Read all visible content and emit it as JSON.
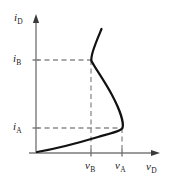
{
  "figure": {
    "type": "diagram",
    "background_color": "#ffffff",
    "curve_color": "#111111",
    "axis_color": "#7a7a7a",
    "dash_color": "#8c8c8c",
    "text_color": "#1a1a1a"
  },
  "axes": {
    "y": {
      "symbol": "i",
      "subscript": "D",
      "label": "iD",
      "arrow": true,
      "origin_px": {
        "x": 36,
        "y": 153
      },
      "top_px": {
        "x": 36,
        "y": 16
      }
    },
    "x": {
      "symbol": "v",
      "subscript": "D",
      "label": "vD",
      "arrow": true,
      "origin_px": {
        "x": 36,
        "y": 153
      },
      "right_px": {
        "x": 160,
        "y": 153
      }
    }
  },
  "ticks": {
    "y_ticks": [
      {
        "symbol": "i",
        "subscript": "B",
        "label": "iB",
        "y_px": 60
      },
      {
        "symbol": "i",
        "subscript": "A",
        "label": "iA",
        "y_px": 128
      }
    ],
    "x_ticks": [
      {
        "symbol": "v",
        "subscript": "B",
        "label": "vB",
        "x_px": 91
      },
      {
        "symbol": "v",
        "subscript": "A",
        "label": "vA",
        "x_px": 122
      }
    ]
  },
  "guide_lines": {
    "style": "dashed",
    "horizontal": [
      {
        "from_x": 36,
        "to_x": 91,
        "y": 60,
        "name": "ib-guide"
      },
      {
        "from_x": 36,
        "to_x": 122,
        "y": 128,
        "name": "ia-guide"
      }
    ],
    "vertical": [
      {
        "x": 91,
        "from_y": 60,
        "to_y": 153,
        "name": "vb-guide"
      },
      {
        "x": 122,
        "from_y": 128,
        "to_y": 153,
        "name": "va-guide"
      }
    ]
  },
  "chart_data": {
    "type": "line",
    "title": "",
    "xlabel": "vD",
    "ylabel": "iD",
    "annotations": [
      "iB",
      "iA",
      "vB",
      "vA"
    ],
    "curve_path": "M 37,152 C 55,149 78,143 98,137 C 112,133 121,131 122.5,128 C 124,123 120,110 112,95 C 104,80 95,68 91.5,61 C 91,59 91.5,56 93,51 C 95.5,43 99,35 101.5,29",
    "key_points": [
      {
        "name": "origin",
        "x_px": 37,
        "y_px": 152
      },
      {
        "name": "peak-A",
        "x_px": 122.5,
        "y_px": 128
      },
      {
        "name": "valley-B",
        "x_px": 91.5,
        "y_px": 60
      },
      {
        "name": "upper-end",
        "x_px": 101.5,
        "y_px": 29
      }
    ]
  }
}
